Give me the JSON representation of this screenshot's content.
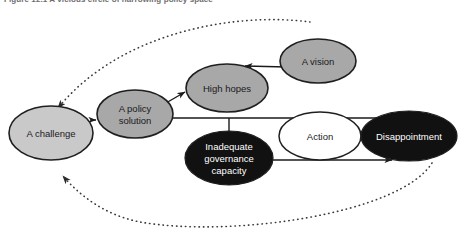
{
  "figure": {
    "caption": "Figure 12.1   A vicious circle of narrowing policy space",
    "background": "#ffffff"
  },
  "palette": {
    "light_gray": "#c9c9c9",
    "medium_gray": "#a8a8a8",
    "white": "#ffffff",
    "black": "#111111",
    "outline": "#1f1f1f",
    "edge": "#1a1a1a",
    "dotted_edge": "#3a3a3a"
  },
  "nodes": [
    {
      "id": "challenge",
      "label": "A challenge",
      "lines": [
        "A challenge"
      ],
      "fill": "#c9c9c9",
      "text_color": "#1a1a1a",
      "cx": 51,
      "cy": 133,
      "rx": 42,
      "ry": 27
    },
    {
      "id": "policy-solution",
      "label": "A policy solution",
      "lines": [
        "A policy",
        "solution"
      ],
      "fill": "#a8a8a8",
      "text_color": "#1a1a1a",
      "cx": 135,
      "cy": 114,
      "rx": 38,
      "ry": 24
    },
    {
      "id": "high-hopes",
      "label": "High hopes",
      "lines": [
        "High hopes"
      ],
      "fill": "#a8a8a8",
      "text_color": "#1a1a1a",
      "cx": 227,
      "cy": 88,
      "rx": 41,
      "ry": 24
    },
    {
      "id": "vision",
      "label": "A vision",
      "lines": [
        "A vision"
      ],
      "fill": "#a8a8a8",
      "text_color": "#1a1a1a",
      "cx": 318,
      "cy": 61,
      "rx": 38,
      "ry": 22
    },
    {
      "id": "governance-capacity",
      "label": "Inadequate governance capacity",
      "lines": [
        "Inadequate",
        "governance",
        "capacity"
      ],
      "fill": "#111111",
      "text_color": "#ffffff",
      "cx": 229,
      "cy": 158,
      "rx": 44,
      "ry": 27
    },
    {
      "id": "action",
      "label": "Action",
      "lines": [
        "Action"
      ],
      "fill": "#ffffff",
      "text_color": "#1a1a1a",
      "cx": 320,
      "cy": 136,
      "rx": 41,
      "ry": 24
    },
    {
      "id": "disappointment",
      "label": "Disappointment",
      "lines": [
        "Disappointment"
      ],
      "fill": "#111111",
      "text_color": "#ffffff",
      "cx": 409,
      "cy": 136,
      "rx": 48,
      "ry": 25
    }
  ],
  "edges": [
    {
      "id": "challenge-to-policy",
      "from": "challenge",
      "to": "policy-solution",
      "style": "solid",
      "arrow": true
    },
    {
      "id": "policy-to-high-hopes",
      "from": "policy-solution",
      "to": "high-hopes",
      "style": "solid",
      "arrow": true
    },
    {
      "id": "vision-to-high-hopes",
      "from": "vision",
      "to": "high-hopes",
      "style": "solid",
      "arrow": true
    },
    {
      "id": "policy-trunk-to-disappointment",
      "from": "policy-solution",
      "to": "disappointment",
      "style": "solid",
      "arrow": true
    },
    {
      "id": "trunk-to-governance",
      "from": "policy-solution",
      "to": "governance-capacity",
      "style": "solid",
      "arrow": false
    },
    {
      "id": "governance-to-disappointment",
      "from": "governance-capacity",
      "to": "disappointment",
      "style": "solid",
      "arrow": true
    },
    {
      "id": "vision-feedback-to-challenge",
      "from": "vision",
      "to": "challenge",
      "style": "dotted",
      "arrow": true
    },
    {
      "id": "disappointment-feedback-to-challenge",
      "from": "disappointment",
      "to": "challenge",
      "style": "dotted",
      "arrow": true
    }
  ]
}
